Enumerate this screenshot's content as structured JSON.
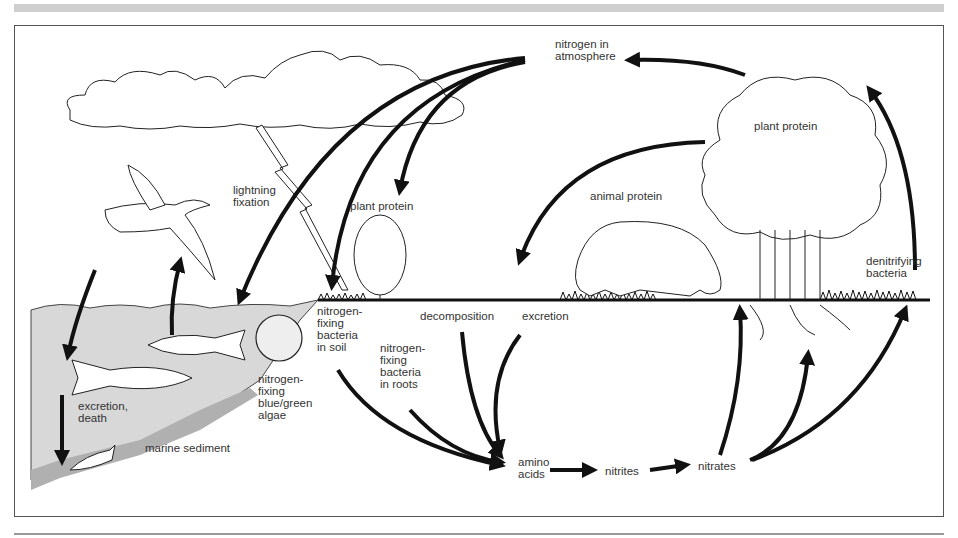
{
  "diagram": {
    "labels": {
      "nitrogen_in_atmosphere": "nitrogen in\natmosphere",
      "plant_protein_tree": "plant protein",
      "plant_protein_bush": "plant protein",
      "animal_protein": "animal protein",
      "lightning_fixation": "lightning\nfixation",
      "denitrifying_bacteria": "denitrifying\nbacteria",
      "n_fixing_bacteria_soil": "nitrogen-\nfixing\nbacteria\nin soil",
      "n_fixing_bacteria_roots": "nitrogen-\nfixing\nbacteria\nin roots",
      "decomposition": "decomposition",
      "excretion": "excretion",
      "n_fixing_algae": "nitrogen-\nfixing\nblue/green\nalgae",
      "excretion_death": "excretion,\ndeath",
      "marine_sediment": "marine sediment",
      "amino_acids": "amino\nacids",
      "nitrites": "nitrites",
      "nitrates": "nitrates"
    },
    "colors": {
      "ink": "#111111",
      "label": "#333333",
      "water": "#d6d6d6",
      "sediment": "#b8b8b8",
      "border": "#555555",
      "top_band": "#cfcfcf"
    }
  }
}
